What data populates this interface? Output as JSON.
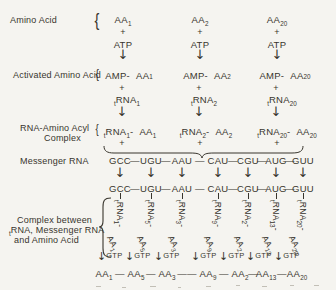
{
  "colors": {
    "background": "#f5f4f0",
    "ink": "#38352d"
  },
  "terms": {
    "aa": "AA",
    "atp": "ATP",
    "amp": "AMP-",
    "rna": "RNA",
    "t_sub": "t",
    "plus": "+",
    "dash": "-",
    "gtp": "GTP",
    "down_arrow": "↓",
    "brace": "{",
    "codon_sep": "—",
    "long_sep": "——"
  },
  "row_labels": {
    "amino_acid": "Amino Acid",
    "activated_amino_acid": "Activated Amino Acid",
    "rna_amino_acyl_line1": "RNA-Amino Acyl",
    "rna_amino_acyl_line2": "Complex",
    "messenger_rna": "Messenger RNA",
    "complex_line1": "Complex between",
    "complex_line2_rest": "RNA, Messenger RNA",
    "complex_line3": "and Amino Acid"
  },
  "amino_acid_columns": [
    {
      "n": "1"
    },
    {
      "n": "2"
    },
    {
      "n": "20"
    }
  ],
  "mrna_codons": [
    "GCC",
    "UGU",
    "AAU",
    "CAU",
    "CGU",
    "AUG",
    "GUU"
  ],
  "trna_columns": [
    {
      "n": "1"
    },
    {
      "n": "5"
    },
    {
      "n": "3"
    },
    {
      "n": "9"
    },
    {
      "n": "2"
    },
    {
      "n": "13"
    },
    {
      "n": "20"
    }
  ],
  "product_chain": [
    {
      "n": "1"
    },
    {
      "n": "5"
    },
    {
      "n": "3"
    },
    {
      "n": "9"
    },
    {
      "n": "2"
    },
    {
      "n": "13"
    },
    {
      "n": "20"
    }
  ]
}
